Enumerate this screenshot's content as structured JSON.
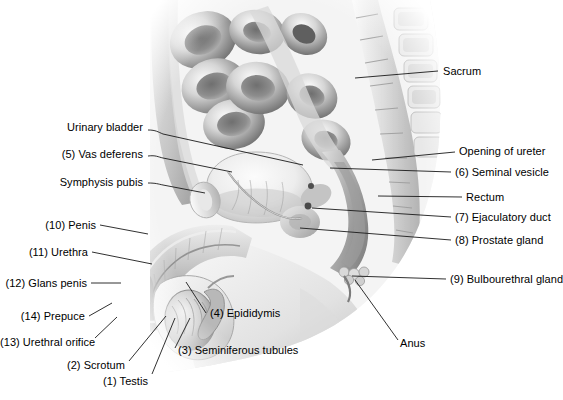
{
  "figure": {
    "background_color": "#ffffff",
    "label_color": "#000000",
    "leader_color": "#1a1a1a",
    "illustration_style": "grayscale-airbrush-medical"
  },
  "labels": [
    {
      "id": "sacrum",
      "text": "Sacrum",
      "side": "right",
      "x": 443,
      "y": 72,
      "lead": [
        [
          438,
          71
        ],
        [
          355,
          78
        ]
      ]
    },
    {
      "id": "opening-of-ureter",
      "text": "Opening of ureter",
      "side": "right",
      "x": 459,
      "y": 152,
      "lead": [
        [
          455,
          152
        ],
        [
          372,
          160
        ]
      ]
    },
    {
      "id": "seminal-vesicle",
      "text": "(6) Seminal vesicle",
      "side": "right",
      "x": 455,
      "y": 173,
      "lead": [
        [
          451,
          172
        ],
        [
          330,
          168
        ]
      ]
    },
    {
      "id": "rectum",
      "text": "Rectum",
      "side": "right",
      "x": 466,
      "y": 198,
      "lead": [
        [
          462,
          197
        ],
        [
          378,
          196
        ]
      ]
    },
    {
      "id": "ejaculatory-duct",
      "text": "(7) Ejaculatory duct",
      "side": "right",
      "x": 455,
      "y": 218,
      "lead": [
        [
          451,
          217
        ],
        [
          312,
          208
        ]
      ]
    },
    {
      "id": "prostate-gland",
      "text": "(8) Prostate gland",
      "side": "right",
      "x": 455,
      "y": 241,
      "lead": [
        [
          451,
          240
        ],
        [
          300,
          228
        ]
      ]
    },
    {
      "id": "bulbourethral-gland",
      "text": "(9) Bulbourethral gland",
      "side": "right",
      "x": 450,
      "y": 280,
      "lead": [
        [
          446,
          279
        ],
        [
          352,
          276
        ]
      ]
    },
    {
      "id": "urinary-bladder",
      "text": "Urinary bladder",
      "side": "left",
      "x": 80,
      "y": 128,
      "lead": [
        [
          148,
          130
        ],
        [
          160,
          133
        ],
        [
          303,
          165
        ]
      ]
    },
    {
      "id": "vas-deferens",
      "text": "(5) Vas deferens",
      "side": "left",
      "x": 57,
      "y": 155,
      "lead": [
        [
          148,
          156
        ],
        [
          160,
          159
        ],
        [
          232,
          172
        ]
      ]
    },
    {
      "id": "symphysis-pubis",
      "text": "Symphysis pubis",
      "side": "left",
      "x": 58,
      "y": 183,
      "lead": [
        [
          148,
          183
        ],
        [
          160,
          184
        ],
        [
          205,
          193
        ]
      ]
    },
    {
      "id": "penis",
      "text": "(10) Penis",
      "side": "left",
      "x": 43,
      "y": 226,
      "lead": [
        [
          100,
          225
        ],
        [
          148,
          234
        ]
      ]
    },
    {
      "id": "urethra",
      "text": "(11) Urethra",
      "side": "left",
      "x": 30,
      "y": 253,
      "lead": [
        [
          92,
          252
        ],
        [
          152,
          264
        ]
      ]
    },
    {
      "id": "glans-penis",
      "text": "(12) Glans penis",
      "side": "left",
      "x": 12,
      "y": 284,
      "lead": [
        [
          91,
          283
        ],
        [
          121,
          283
        ]
      ]
    },
    {
      "id": "prepuce",
      "text": "(14) Prepuce",
      "side": "left",
      "x": 30,
      "y": 318,
      "lead": [
        [
          89,
          316
        ],
        [
          112,
          303
        ]
      ]
    },
    {
      "id": "urethral-orifice",
      "text": "(13) Urethral orifice",
      "side": "left",
      "x": 10,
      "y": 343,
      "lead": [
        [
          95,
          338
        ],
        [
          117,
          317
        ]
      ]
    },
    {
      "id": "scrotum",
      "text": "(2) Scrotum",
      "side": "left",
      "x": 75,
      "y": 366,
      "lead": [
        [
          129,
          361
        ],
        [
          166,
          316
        ]
      ]
    },
    {
      "id": "testis",
      "text": "(1) Testis",
      "side": "left",
      "x": 118,
      "y": 382,
      "lead": [
        [
          152,
          374
        ],
        [
          175,
          318
        ]
      ]
    },
    {
      "id": "epididymis",
      "text": "(4) Epididymis",
      "side": "left",
      "x": 210,
      "y": 314,
      "lead": [
        [
          206,
          313
        ],
        [
          186,
          282
        ]
      ]
    },
    {
      "id": "seminiferous-tubules",
      "text": "(3) Seminiferous tubules",
      "side": "left",
      "x": 178,
      "y": 352,
      "lead": [
        [
          175,
          348
        ],
        [
          190,
          318
        ]
      ]
    },
    {
      "id": "anus",
      "text": "Anus",
      "side": "left",
      "x": 400,
      "y": 344,
      "lead": [
        [
          398,
          340
        ],
        [
          355,
          280
        ]
      ]
    }
  ],
  "numbered_key": [
    {
      "number": "1",
      "name": "Testis"
    },
    {
      "number": "2",
      "name": "Scrotum"
    },
    {
      "number": "3",
      "name": "Seminiferous tubules"
    },
    {
      "number": "4",
      "name": "Epididymis"
    },
    {
      "number": "5",
      "name": "Vas deferens"
    },
    {
      "number": "6",
      "name": "Seminal vesicle"
    },
    {
      "number": "7",
      "name": "Ejaculatory duct"
    },
    {
      "number": "8",
      "name": "Prostate gland"
    },
    {
      "number": "9",
      "name": "Bulbourethral gland"
    },
    {
      "number": "10",
      "name": "Penis"
    },
    {
      "number": "11",
      "name": "Urethra"
    },
    {
      "number": "12",
      "name": "Glans penis"
    },
    {
      "number": "13",
      "name": "Urethral orifice"
    },
    {
      "number": "14",
      "name": "Prepuce"
    }
  ],
  "unnumbered_structures": [
    "Sacrum",
    "Urinary bladder",
    "Symphysis pubis",
    "Opening of ureter",
    "Rectum",
    "Anus"
  ]
}
